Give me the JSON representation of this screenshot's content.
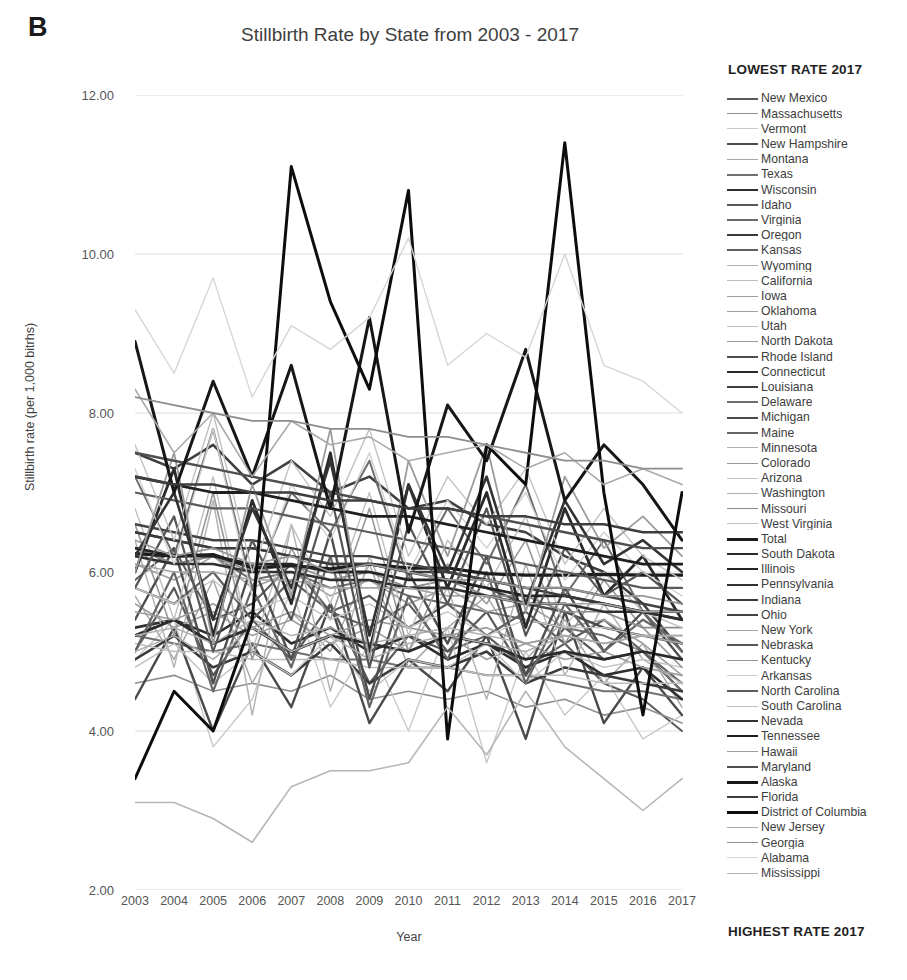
{
  "panel": {
    "letter": "B"
  },
  "header": {
    "title": "Stillbirth Rate by State from 2003 - 2017"
  },
  "axes": {
    "y_title": "Stillbirth rate (per 1,000 bitrhs)",
    "x_title": "Year",
    "y_ticks": [
      "12.00",
      "10.00",
      "8.00",
      "6.00",
      "4.00",
      "2.00"
    ],
    "x_ticks": [
      "2003",
      "2004",
      "2005",
      "2006",
      "2007",
      "2008",
      "2009",
      "2010",
      "2011",
      "2012",
      "2013",
      "2014",
      "2015",
      "2016",
      "2017"
    ]
  },
  "legend": {
    "header": "LOWEST RATE 2017",
    "footer": "HIGHEST RATE 2017"
  },
  "chart_data": {
    "type": "line",
    "title": "Stillbirth Rate by State from 2003 - 2017",
    "xlabel": "Year",
    "ylabel": "Stillbirth rate (per 1,000 bitrhs)",
    "ylim": [
      2.0,
      12.0
    ],
    "y_tick_values": [
      12.0,
      10.0,
      8.0,
      6.0,
      4.0,
      2.0
    ],
    "grid": "horizontal",
    "legend_position": "right",
    "legend_header": "LOWEST RATE 2017",
    "legend_footer": "HIGHEST RATE 2017",
    "x": [
      2003,
      2004,
      2005,
      2006,
      2007,
      2008,
      2009,
      2010,
      2011,
      2012,
      2013,
      2014,
      2015,
      2016,
      2017
    ],
    "series": [
      {
        "name": "New Mexico",
        "color": "#5a5a5a",
        "width": 2.0,
        "values": [
          5.9,
          6.3,
          5.4,
          5.6,
          6.1,
          5.5,
          5.3,
          5.6,
          5.0,
          5.2,
          4.8,
          5.1,
          4.6,
          4.4,
          4.0
        ]
      },
      {
        "name": "Massachusetts",
        "color": "#8f8f8f",
        "width": 1.6,
        "values": [
          4.6,
          4.7,
          4.5,
          4.6,
          4.5,
          4.7,
          4.4,
          4.5,
          4.4,
          4.5,
          4.3,
          4.4,
          4.2,
          4.3,
          4.1
        ]
      },
      {
        "name": "Vermont",
        "color": "#c8c8c8",
        "width": 1.4,
        "values": [
          4.9,
          5.4,
          3.8,
          4.4,
          5.8,
          4.3,
          5.1,
          4.0,
          5.3,
          3.6,
          5.0,
          4.2,
          4.7,
          3.9,
          4.2
        ]
      },
      {
        "name": "New Hampshire",
        "color": "#4a4a4a",
        "width": 2.4,
        "values": [
          4.4,
          5.3,
          4.0,
          5.1,
          4.3,
          5.6,
          4.1,
          4.9,
          4.5,
          5.2,
          3.9,
          5.5,
          4.1,
          4.8,
          4.2
        ]
      },
      {
        "name": "Montana",
        "color": "#a8a8a8",
        "width": 1.5,
        "values": [
          5.7,
          4.9,
          5.9,
          4.6,
          5.5,
          5.0,
          6.1,
          4.8,
          5.3,
          5.7,
          4.9,
          5.4,
          4.6,
          5.1,
          4.3
        ]
      },
      {
        "name": "Texas",
        "color": "#707070",
        "width": 2.0,
        "values": [
          5.2,
          5.1,
          5.0,
          5.1,
          5.0,
          4.9,
          4.9,
          4.8,
          4.8,
          4.7,
          4.7,
          4.6,
          4.5,
          4.5,
          4.4
        ]
      },
      {
        "name": "Wisconsin",
        "color": "#2e2e2e",
        "width": 2.6,
        "values": [
          5.3,
          5.4,
          5.2,
          5.5,
          5.1,
          5.3,
          5.0,
          5.2,
          4.9,
          5.1,
          4.8,
          5.0,
          4.7,
          4.8,
          4.4
        ]
      },
      {
        "name": "Idaho",
        "color": "#585858",
        "width": 2.2,
        "values": [
          5.0,
          5.8,
          4.7,
          5.4,
          4.9,
          5.6,
          4.6,
          5.2,
          5.0,
          5.5,
          4.7,
          5.3,
          4.9,
          5.0,
          4.5
        ]
      },
      {
        "name": "Virginia",
        "color": "#6b6b6b",
        "width": 2.0,
        "values": [
          6.3,
          6.1,
          6.2,
          5.9,
          6.0,
          5.8,
          5.9,
          5.7,
          5.6,
          5.5,
          5.4,
          5.3,
          5.2,
          5.0,
          4.5
        ]
      },
      {
        "name": "Oregon",
        "color": "#3a3a3a",
        "width": 2.6,
        "values": [
          4.9,
          5.2,
          4.8,
          5.0,
          4.7,
          5.1,
          4.6,
          4.9,
          4.8,
          5.0,
          4.6,
          4.8,
          4.7,
          4.6,
          4.5
        ]
      },
      {
        "name": "Kansas",
        "color": "#5f5f5f",
        "width": 2.2,
        "values": [
          5.8,
          5.6,
          6.0,
          5.4,
          5.9,
          5.5,
          5.7,
          5.3,
          5.6,
          5.2,
          5.5,
          5.1,
          5.4,
          5.0,
          4.6
        ]
      },
      {
        "name": "Wyoming",
        "color": "#b4b4b4",
        "width": 1.5,
        "values": [
          6.4,
          4.8,
          6.9,
          4.2,
          6.6,
          4.5,
          6.2,
          5.0,
          5.8,
          4.4,
          6.1,
          4.7,
          5.6,
          4.9,
          4.6
        ]
      },
      {
        "name": "California",
        "color": "#bdbdbd",
        "width": 1.5,
        "values": [
          5.1,
          5.0,
          5.0,
          4.9,
          4.9,
          4.9,
          4.8,
          4.8,
          4.8,
          4.7,
          4.7,
          4.7,
          4.6,
          4.6,
          4.6
        ]
      },
      {
        "name": "Iowa",
        "color": "#9e9e9e",
        "width": 1.6,
        "values": [
          5.6,
          5.3,
          5.5,
          5.2,
          5.4,
          5.1,
          5.3,
          5.0,
          5.2,
          4.9,
          5.1,
          4.9,
          5.0,
          4.8,
          4.7
        ]
      },
      {
        "name": "Oklahoma",
        "color": "#a0a0a0",
        "width": 1.6,
        "values": [
          6.1,
          5.9,
          6.2,
          5.8,
          6.0,
          5.7,
          5.9,
          5.6,
          5.8,
          5.5,
          5.6,
          5.3,
          5.4,
          5.1,
          4.7
        ]
      },
      {
        "name": "Utah",
        "color": "#c0c0c0",
        "width": 1.4,
        "values": [
          4.8,
          5.1,
          4.6,
          5.0,
          4.7,
          5.2,
          4.5,
          4.9,
          4.8,
          5.1,
          4.6,
          5.0,
          4.8,
          4.9,
          4.8
        ]
      },
      {
        "name": "North Dakota",
        "color": "#989898",
        "width": 1.6,
        "values": [
          6.6,
          5.2,
          7.0,
          4.9,
          6.3,
          5.4,
          6.8,
          5.0,
          6.1,
          5.6,
          6.4,
          5.1,
          5.9,
          5.3,
          4.8
        ]
      },
      {
        "name": "Rhode Island",
        "color": "#4e4e4e",
        "width": 2.4,
        "values": [
          5.4,
          6.3,
          4.6,
          6.1,
          4.9,
          6.5,
          4.4,
          6.0,
          5.1,
          6.2,
          4.7,
          5.8,
          5.0,
          5.5,
          4.9
        ]
      },
      {
        "name": "Connecticut",
        "color": "#2b2b2b",
        "width": 2.8,
        "values": [
          5.2,
          5.4,
          5.1,
          5.3,
          5.0,
          5.2,
          5.1,
          5.0,
          5.2,
          5.1,
          4.9,
          5.0,
          4.9,
          5.0,
          4.9
        ]
      },
      {
        "name": "Louisiana",
        "color": "#3f3f3f",
        "width": 2.6,
        "values": [
          7.5,
          7.3,
          7.6,
          7.1,
          7.4,
          7.0,
          7.2,
          6.8,
          6.9,
          6.6,
          6.5,
          6.2,
          6.0,
          5.6,
          5.0
        ]
      },
      {
        "name": "Delaware",
        "color": "#6e6e6e",
        "width": 2.0,
        "values": [
          7.2,
          6.2,
          7.8,
          5.8,
          7.0,
          6.5,
          7.4,
          5.9,
          6.8,
          6.1,
          7.1,
          5.7,
          6.4,
          5.5,
          5.0
        ]
      },
      {
        "name": "Michigan",
        "color": "#4b4b4b",
        "width": 2.4,
        "values": [
          6.5,
          6.4,
          6.3,
          6.3,
          6.2,
          6.1,
          6.1,
          6.0,
          5.9,
          5.8,
          5.6,
          5.5,
          5.3,
          5.2,
          5.1
        ]
      },
      {
        "name": "Maine",
        "color": "#666666",
        "width": 2.2,
        "values": [
          5.0,
          6.0,
          4.5,
          5.8,
          4.8,
          6.2,
          4.3,
          5.7,
          4.9,
          6.0,
          4.6,
          5.6,
          5.0,
          5.4,
          5.1
        ]
      },
      {
        "name": "Minnesota",
        "color": "#b0b0b0",
        "width": 1.5,
        "values": [
          5.2,
          5.3,
          5.1,
          5.4,
          5.2,
          5.3,
          5.1,
          5.2,
          5.3,
          5.2,
          5.1,
          5.2,
          5.1,
          5.2,
          5.1
        ]
      },
      {
        "name": "Colorado",
        "color": "#9a9a9a",
        "width": 1.6,
        "values": [
          5.5,
          5.4,
          5.6,
          5.3,
          5.5,
          5.2,
          5.4,
          5.3,
          5.2,
          5.3,
          5.1,
          5.2,
          5.1,
          5.2,
          5.2
        ]
      },
      {
        "name": "Arizona",
        "color": "#c5c5c5",
        "width": 1.4,
        "values": [
          5.8,
          5.6,
          5.9,
          5.5,
          5.7,
          5.4,
          5.6,
          5.3,
          5.5,
          5.2,
          5.4,
          5.3,
          5.3,
          5.2,
          5.2
        ]
      },
      {
        "name": "Washington",
        "color": "#aeaeae",
        "width": 1.5,
        "values": [
          5.0,
          5.2,
          4.9,
          5.3,
          5.0,
          5.2,
          4.9,
          5.1,
          5.2,
          5.1,
          5.0,
          5.2,
          5.1,
          5.2,
          5.2
        ]
      },
      {
        "name": "Missouri",
        "color": "#8a8a8a",
        "width": 1.7,
        "values": [
          6.3,
          6.1,
          6.2,
          6.0,
          6.1,
          5.9,
          6.0,
          5.8,
          5.9,
          5.7,
          5.7,
          5.5,
          5.5,
          5.3,
          5.3
        ]
      },
      {
        "name": "West Virginia",
        "color": "#bfbfbf",
        "width": 1.4,
        "values": [
          6.8,
          5.4,
          7.2,
          5.0,
          6.6,
          5.6,
          7.0,
          5.2,
          6.4,
          5.8,
          6.7,
          5.3,
          6.0,
          5.5,
          5.3
        ]
      },
      {
        "name": "Total",
        "color": "#1c1c1c",
        "width": 3.2,
        "values": [
          6.23,
          6.2,
          6.22,
          6.05,
          6.08,
          6.04,
          6.1,
          6.05,
          6.05,
          5.98,
          5.96,
          5.96,
          5.97,
          5.96,
          5.96
        ]
      },
      {
        "name": "South Dakota",
        "color": "#2a2a2a",
        "width": 2.8,
        "values": [
          6.0,
          7.3,
          5.2,
          6.9,
          5.6,
          7.5,
          5.0,
          7.1,
          5.8,
          7.0,
          5.3,
          6.8,
          5.7,
          6.2,
          5.4
        ]
      },
      {
        "name": "Illinois",
        "color": "#232323",
        "width": 2.8,
        "values": [
          6.3,
          6.2,
          6.2,
          6.1,
          6.1,
          6.0,
          6.0,
          5.9,
          5.9,
          5.8,
          5.7,
          5.7,
          5.6,
          5.5,
          5.4
        ]
      },
      {
        "name": "Pennsylvania",
        "color": "#303030",
        "width": 2.6,
        "values": [
          6.2,
          6.1,
          6.1,
          6.0,
          6.0,
          5.9,
          5.9,
          5.8,
          5.8,
          5.7,
          5.6,
          5.6,
          5.5,
          5.5,
          5.4
        ]
      },
      {
        "name": "Indiana",
        "color": "#3b3b3b",
        "width": 2.5,
        "values": [
          6.5,
          6.4,
          6.3,
          6.3,
          6.2,
          6.1,
          6.1,
          6.0,
          6.0,
          5.9,
          5.8,
          5.7,
          5.6,
          5.5,
          5.5
        ]
      },
      {
        "name": "Ohio",
        "color": "#434343",
        "width": 2.4,
        "values": [
          6.6,
          6.5,
          6.4,
          6.4,
          6.3,
          6.2,
          6.2,
          6.1,
          6.0,
          5.9,
          5.8,
          5.8,
          5.7,
          5.6,
          5.5
        ]
      },
      {
        "name": "New York",
        "color": "#a5a5a5",
        "width": 1.6,
        "values": [
          6.1,
          6.0,
          6.0,
          5.9,
          5.9,
          5.8,
          5.8,
          5.8,
          5.7,
          5.7,
          5.6,
          5.6,
          5.6,
          5.5,
          5.5
        ]
      },
      {
        "name": "Nebraska",
        "color": "#555555",
        "width": 2.2,
        "values": [
          5.8,
          6.7,
          5.0,
          6.4,
          5.4,
          7.0,
          4.8,
          6.6,
          5.6,
          6.8,
          5.2,
          6.3,
          5.7,
          6.0,
          5.6
        ]
      },
      {
        "name": "Kentucky",
        "color": "#979797",
        "width": 1.7,
        "values": [
          6.4,
          6.2,
          6.3,
          6.1,
          6.2,
          6.0,
          6.1,
          6.0,
          5.9,
          5.9,
          5.8,
          5.8,
          5.7,
          5.7,
          5.6
        ]
      },
      {
        "name": "Arkansas",
        "color": "#d0d0d0",
        "width": 1.4,
        "values": [
          7.3,
          6.1,
          7.8,
          5.7,
          7.1,
          6.4,
          7.5,
          6.0,
          6.9,
          6.3,
          7.0,
          5.9,
          6.5,
          6.0,
          5.7
        ]
      },
      {
        "name": "North Carolina",
        "color": "#5c5c5c",
        "width": 2.2,
        "values": [
          7.0,
          6.9,
          6.8,
          6.8,
          6.7,
          6.6,
          6.5,
          6.4,
          6.3,
          6.2,
          6.1,
          6.0,
          5.9,
          5.8,
          5.8
        ]
      },
      {
        "name": "South Carolina",
        "color": "#c2c2c2",
        "width": 1.4,
        "values": [
          7.6,
          6.4,
          8.0,
          6.0,
          7.4,
          6.7,
          7.8,
          6.2,
          7.2,
          6.6,
          7.3,
          6.1,
          6.8,
          6.2,
          5.9
        ]
      },
      {
        "name": "Nevada",
        "color": "#333333",
        "width": 2.6,
        "values": [
          6.2,
          7.0,
          5.4,
          6.8,
          5.8,
          7.4,
          5.2,
          7.1,
          6.0,
          7.2,
          5.6,
          6.9,
          6.1,
          6.4,
          6.0
        ]
      },
      {
        "name": "Tennessee",
        "color": "#1f1f1f",
        "width": 2.8,
        "values": [
          7.2,
          7.1,
          7.0,
          7.0,
          6.9,
          6.8,
          6.7,
          6.7,
          6.6,
          6.5,
          6.4,
          6.3,
          6.2,
          6.1,
          6.1
        ]
      },
      {
        "name": "Hawaii",
        "color": "#9c9c9c",
        "width": 1.8,
        "values": [
          6.0,
          7.5,
          5.1,
          7.1,
          5.7,
          7.8,
          4.9,
          7.4,
          6.2,
          7.6,
          5.5,
          7.2,
          6.3,
          6.7,
          6.2
        ]
      },
      {
        "name": "Maryland",
        "color": "#4f4f4f",
        "width": 2.4,
        "values": [
          7.5,
          7.4,
          7.3,
          7.2,
          7.1,
          7.0,
          6.9,
          6.8,
          6.8,
          6.7,
          6.6,
          6.5,
          6.4,
          6.3,
          6.3
        ]
      },
      {
        "name": "Alaska",
        "color": "#171717",
        "width": 3.0,
        "values": [
          8.9,
          7.0,
          8.4,
          7.2,
          8.6,
          6.8,
          9.2,
          6.5,
          8.1,
          7.4,
          8.8,
          6.9,
          7.6,
          7.1,
          6.4
        ]
      },
      {
        "name": "Florida",
        "color": "#3d3d3d",
        "width": 2.5,
        "values": [
          7.2,
          7.1,
          7.1,
          7.0,
          7.0,
          6.9,
          6.9,
          6.8,
          6.8,
          6.7,
          6.7,
          6.6,
          6.6,
          6.5,
          6.5
        ]
      },
      {
        "name": "District of Columbia",
        "color": "#0d0d0d",
        "width": 3.0,
        "values": [
          3.4,
          4.5,
          4.0,
          5.4,
          11.1,
          9.4,
          8.3,
          10.8,
          3.9,
          7.6,
          7.1,
          11.4,
          7.0,
          4.2,
          7.0
        ]
      },
      {
        "name": "New Jersey",
        "color": "#aaaaaa",
        "width": 1.6,
        "values": [
          8.3,
          7.5,
          8.0,
          7.2,
          7.9,
          7.6,
          7.7,
          7.4,
          7.5,
          7.6,
          7.3,
          7.5,
          7.1,
          7.3,
          7.1
        ]
      },
      {
        "name": "Georgia",
        "color": "#8d8d8d",
        "width": 1.8,
        "values": [
          8.2,
          8.1,
          8.0,
          7.9,
          7.9,
          7.8,
          7.8,
          7.7,
          7.7,
          7.6,
          7.5,
          7.4,
          7.4,
          7.3,
          7.3
        ]
      },
      {
        "name": "Alabama",
        "color": "#d6d6d6",
        "width": 1.4,
        "values": [
          9.3,
          8.5,
          9.7,
          8.2,
          9.1,
          8.8,
          9.2,
          10.2,
          8.6,
          9.0,
          8.7,
          10.0,
          8.6,
          8.4,
          8.0
        ]
      },
      {
        "name": "Mississippi",
        "color": "#b6b6b6",
        "width": 1.6,
        "values": [
          3.1,
          3.1,
          2.9,
          2.6,
          3.3,
          3.5,
          3.5,
          3.6,
          4.3,
          3.7,
          4.5,
          3.8,
          3.4,
          3.0,
          3.4
        ]
      }
    ]
  }
}
